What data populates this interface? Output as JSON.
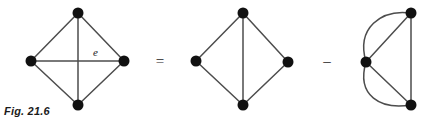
{
  "figure": {
    "caption": "Fig. 21.6",
    "background_color": "#ffffff",
    "edge_color": "#4d4d4d",
    "vertex_color": "#111111",
    "vertex_radius": 5.5,
    "operators": [
      {
        "symbol": "=",
        "x": 160,
        "y": 66
      },
      {
        "symbol": "–",
        "x": 327,
        "y": 66
      }
    ],
    "labels": [
      {
        "text": "e",
        "x": 93,
        "y": 56
      }
    ],
    "graphs": [
      {
        "name": "graph-left",
        "description": "diamond with both diagonals",
        "vertices": [
          {
            "id": "top",
            "x": 78,
            "y": 13
          },
          {
            "id": "left",
            "x": 31,
            "y": 61
          },
          {
            "id": "right",
            "x": 124,
            "y": 61
          },
          {
            "id": "bottom",
            "x": 78,
            "y": 105
          }
        ],
        "edges": [
          {
            "from": "top",
            "to": "left",
            "type": "straight"
          },
          {
            "from": "top",
            "to": "right",
            "type": "straight"
          },
          {
            "from": "left",
            "to": "bottom",
            "type": "straight"
          },
          {
            "from": "right",
            "to": "bottom",
            "type": "straight"
          },
          {
            "from": "top",
            "to": "bottom",
            "type": "straight"
          },
          {
            "from": "left",
            "to": "right",
            "type": "straight",
            "label": "e"
          }
        ]
      },
      {
        "name": "graph-middle",
        "description": "diamond with vertical diagonal only",
        "vertices": [
          {
            "id": "top",
            "x": 243,
            "y": 13
          },
          {
            "id": "left",
            "x": 196,
            "y": 61
          },
          {
            "id": "right",
            "x": 288,
            "y": 62
          },
          {
            "id": "bottom",
            "x": 243,
            "y": 105
          }
        ],
        "edges": [
          {
            "from": "top",
            "to": "left",
            "type": "straight"
          },
          {
            "from": "top",
            "to": "right",
            "type": "straight"
          },
          {
            "from": "left",
            "to": "bottom",
            "type": "straight"
          },
          {
            "from": "right",
            "to": "bottom",
            "type": "straight"
          },
          {
            "from": "top",
            "to": "bottom",
            "type": "straight"
          }
        ]
      },
      {
        "name": "graph-right",
        "description": "three vertices with two pairs of parallel edges",
        "vertices": [
          {
            "id": "left",
            "x": 366,
            "y": 62
          },
          {
            "id": "topright",
            "x": 411,
            "y": 13
          },
          {
            "id": "bottomright",
            "x": 411,
            "y": 105
          }
        ],
        "edges": [
          {
            "from": "left",
            "to": "topright",
            "type": "straight"
          },
          {
            "from": "left",
            "to": "topright",
            "type": "curved"
          },
          {
            "from": "left",
            "to": "bottomright",
            "type": "straight"
          },
          {
            "from": "left",
            "to": "bottomright",
            "type": "curved"
          },
          {
            "from": "topright",
            "to": "bottomright",
            "type": "straight"
          }
        ]
      }
    ]
  }
}
